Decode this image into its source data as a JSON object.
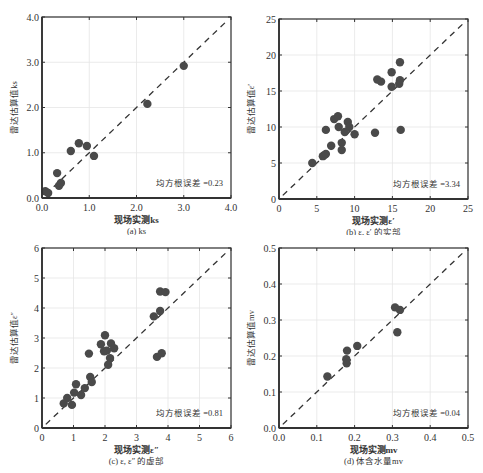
{
  "chart_data": [
    {
      "id": "a",
      "type": "scatter",
      "title": "",
      "caption": "(a) ks",
      "xlabel": "现场实测ks",
      "ylabel": "雷达估算值ks",
      "xlim": [
        0,
        4
      ],
      "ylim": [
        0,
        4
      ],
      "xticks": [
        0,
        1,
        2,
        3,
        4
      ],
      "yticks": [
        0,
        1,
        2,
        3,
        4
      ],
      "xtick_labels": [
        "0.0",
        "1.0",
        "2.0",
        "3.0",
        "4.0"
      ],
      "ytick_labels": [
        "0.0",
        "1.0",
        "2.0",
        "3.0",
        "4.0"
      ],
      "grid": true,
      "reference_line": "y=x (dashed)",
      "annotation": "均方根误差 =0.23",
      "rmse": 0.23,
      "points": [
        [
          0.07,
          0.15
        ],
        [
          0.13,
          0.11
        ],
        [
          0.32,
          0.55
        ],
        [
          0.36,
          0.27
        ],
        [
          0.4,
          0.33
        ],
        [
          0.61,
          1.04
        ],
        [
          0.78,
          1.21
        ],
        [
          0.95,
          1.15
        ],
        [
          1.1,
          0.93
        ],
        [
          2.23,
          2.08
        ],
        [
          3.0,
          2.92
        ]
      ]
    },
    {
      "id": "b",
      "type": "scatter",
      "title": "",
      "caption": "(b) ε, ε′ 的实部",
      "xlabel": "现场实测ε′",
      "ylabel": "雷达估算值ε′",
      "xlim": [
        0,
        25
      ],
      "ylim": [
        0,
        25
      ],
      "xticks": [
        0,
        5,
        10,
        15,
        20,
        25
      ],
      "yticks": [
        0,
        5,
        10,
        15,
        20,
        25
      ],
      "xtick_labels": [
        "0",
        "5",
        "10",
        "15",
        "20",
        "25"
      ],
      "ytick_labels": [
        "0",
        "5",
        "10",
        "15",
        "20",
        "25"
      ],
      "grid": true,
      "reference_line": "y=x (dashed)",
      "annotation": "均方根误差 =3.34",
      "rmse": 3.34,
      "points": [
        [
          4.4,
          5.0
        ],
        [
          5.8,
          5.95
        ],
        [
          6.0,
          6.1
        ],
        [
          6.2,
          6.25
        ],
        [
          6.9,
          7.4
        ],
        [
          8.3,
          7.8
        ],
        [
          8.3,
          6.8
        ],
        [
          6.2,
          9.6
        ],
        [
          7.3,
          11.1
        ],
        [
          7.8,
          11.5
        ],
        [
          7.9,
          10.0
        ],
        [
          9.1,
          10.7
        ],
        [
          9.3,
          10.0
        ],
        [
          8.7,
          9.3
        ],
        [
          10.0,
          9.0
        ],
        [
          12.7,
          9.2
        ],
        [
          13.0,
          16.6
        ],
        [
          13.5,
          16.3
        ],
        [
          14.9,
          17.6
        ],
        [
          14.9,
          15.6
        ],
        [
          15.9,
          16.0
        ],
        [
          16.0,
          16.5
        ],
        [
          16.0,
          19.0
        ],
        [
          16.1,
          9.6
        ]
      ]
    },
    {
      "id": "c",
      "type": "scatter",
      "title": "",
      "caption": "(c) ε, ε″ 的虚部",
      "xlabel": "现场实测ε″",
      "ylabel": "雷达估算值ε″",
      "xlim": [
        0,
        6
      ],
      "ylim": [
        0,
        6
      ],
      "xticks": [
        0,
        1,
        2,
        3,
        4,
        5,
        6
      ],
      "yticks": [
        0,
        1,
        2,
        3,
        4,
        5,
        6
      ],
      "xtick_labels": [
        "0",
        "1",
        "2",
        "3",
        "4",
        "5",
        "6"
      ],
      "ytick_labels": [
        "0",
        "1",
        "2",
        "3",
        "4",
        "5",
        "6"
      ],
      "grid": true,
      "reference_line": "y=x (dashed)",
      "annotation": "均方根误差 =0.81",
      "rmse": 0.81,
      "points": [
        [
          0.69,
          0.82
        ],
        [
          0.8,
          1.0
        ],
        [
          0.95,
          0.77
        ],
        [
          1.02,
          1.18
        ],
        [
          1.08,
          1.46
        ],
        [
          1.24,
          1.1
        ],
        [
          1.36,
          1.33
        ],
        [
          1.49,
          2.48
        ],
        [
          1.53,
          1.7
        ],
        [
          1.58,
          1.53
        ],
        [
          1.87,
          2.79
        ],
        [
          2.0,
          3.09
        ],
        [
          1.97,
          2.56
        ],
        [
          2.06,
          2.58
        ],
        [
          2.19,
          2.82
        ],
        [
          2.29,
          2.66
        ],
        [
          2.16,
          2.33
        ],
        [
          2.1,
          2.11
        ],
        [
          3.55,
          3.72
        ],
        [
          3.75,
          3.9
        ],
        [
          3.75,
          4.55
        ],
        [
          3.92,
          4.53
        ],
        [
          3.65,
          2.37
        ],
        [
          3.8,
          2.49
        ]
      ]
    },
    {
      "id": "d",
      "type": "scatter",
      "title": "",
      "caption": "(d) 体含水量mv",
      "xlabel": "现场实测mv",
      "ylabel": "雷达估算值mv",
      "xlim": [
        0,
        0.5
      ],
      "ylim": [
        0,
        0.5
      ],
      "xticks": [
        0,
        0.1,
        0.2,
        0.3,
        0.4,
        0.5
      ],
      "yticks": [
        0,
        0.1,
        0.2,
        0.3,
        0.4,
        0.5
      ],
      "xtick_labels": [
        "0.0",
        "0.1",
        "0.2",
        "0.3",
        "0.4",
        "0.5"
      ],
      "ytick_labels": [
        "0.0",
        "0.1",
        "0.2",
        "0.3",
        "0.4",
        "0.5"
      ],
      "grid": true,
      "reference_line": "y=x (dashed)",
      "annotation": "均方根误差 =0.04",
      "rmse": 0.04,
      "points": [
        [
          0.128,
          0.143
        ],
        [
          0.178,
          0.191
        ],
        [
          0.179,
          0.18
        ],
        [
          0.18,
          0.215
        ],
        [
          0.207,
          0.228
        ],
        [
          0.307,
          0.335
        ],
        [
          0.32,
          0.328
        ],
        [
          0.313,
          0.266
        ]
      ]
    }
  ],
  "style": {
    "marker_color": "#4a4a4a",
    "axis_color": "#333333",
    "grid_color": "#e6e6e6",
    "text_color": "#333333"
  }
}
